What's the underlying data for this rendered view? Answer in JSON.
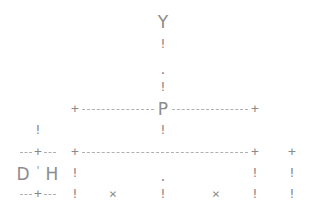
{
  "diagram": {
    "labels": {
      "top": "Y",
      "center": "P",
      "left_a": "D",
      "left_apos": "'",
      "left_b": "H"
    },
    "glyphs": {
      "joint": "+",
      "bar": "!",
      "dot": ".",
      "cross": "×"
    },
    "color": "#8a8a8a"
  }
}
